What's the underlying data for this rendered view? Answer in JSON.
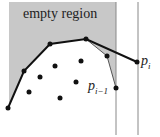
{
  "diagram": {
    "labels": {
      "region": "empty region",
      "p_i_base": "p",
      "p_i_sub": "i",
      "p_im1_base": "p",
      "p_im1_sub": "i−1"
    },
    "colors": {
      "region_fill": "#c8c8c8",
      "line": "#111111",
      "guide": "#888888",
      "point": "#111111"
    },
    "hull_upper": [
      [
        8,
        108
      ],
      [
        24,
        71
      ],
      [
        50,
        44
      ],
      [
        86,
        39
      ],
      [
        137,
        62
      ]
    ],
    "hull_lower_chain": [
      [
        86,
        39
      ],
      [
        107,
        56
      ],
      [
        116,
        88
      ]
    ],
    "interior_points": [
      [
        40,
        77
      ],
      [
        55,
        66
      ],
      [
        81,
        61
      ],
      [
        76,
        82
      ],
      [
        29,
        92
      ],
      [
        60,
        98
      ]
    ],
    "vertical_lines_x": [
      116,
      138
    ]
  }
}
